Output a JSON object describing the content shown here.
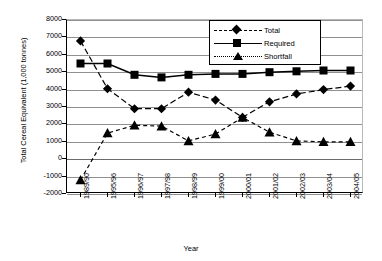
{
  "chart_data": {
    "type": "line",
    "title": "",
    "xlabel": "Year",
    "ylabel": "Total Cereal Equivalent (1,000 tonnes)",
    "categories": [
      "1989/90",
      "1995/96",
      "1996/97",
      "1997/98",
      "1998/99",
      "1999/00",
      "2000/01",
      "2001/02",
      "2002/03",
      "2003/04",
      "2004/05"
    ],
    "ylim": [
      -2000,
      8000
    ],
    "yticks": [
      8000,
      7000,
      6000,
      5000,
      4000,
      3000,
      2000,
      1000,
      0,
      -1000,
      -2000
    ],
    "ytick_labels": [
      "8000",
      "7000",
      "6000",
      "5000",
      "4000",
      "3000",
      "2000",
      "1000",
      "0",
      "-1000",
      "-2000"
    ],
    "grid": true,
    "legend_position": "top-right",
    "series": [
      {
        "name": "Total",
        "marker": "diamond",
        "linestyle": "dashed",
        "values": [
          6800,
          4050,
          2900,
          2900,
          3850,
          3400,
          2400,
          3300,
          3750,
          4000,
          4200
        ]
      },
      {
        "name": "Required",
        "marker": "square",
        "linestyle": "solid",
        "values": [
          5500,
          5500,
          4850,
          4700,
          4850,
          4900,
          4900,
          5000,
          5050,
          5100,
          5100
        ]
      },
      {
        "name": "Shortfall",
        "marker": "triangle",
        "linestyle": "dashed",
        "values": [
          -1200,
          1500,
          1950,
          1900,
          1050,
          1450,
          2400,
          1550,
          1050,
          1000,
          1000
        ]
      }
    ]
  },
  "legend": {
    "items": [
      {
        "label": "Total"
      },
      {
        "label": "Required"
      },
      {
        "label": "Shortfall"
      }
    ]
  },
  "axis": {
    "x_title": "Year",
    "y_title": "Total Cereal Equivalent (1,000 tonnes)"
  }
}
